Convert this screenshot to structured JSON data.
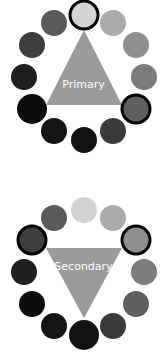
{
  "wheels": [
    {
      "name": "primary",
      "label": "Primary",
      "triangle_color": "#9a9a9a",
      "triangle_orientation": "up",
      "circle_colors": [
        "#d3d3d3",
        "#ababab",
        "#8f8f8f",
        "#7b7b7b",
        "#5f5f5f",
        "#3a3a3a",
        "#111111",
        "#141414",
        "#0d0d0d",
        "#0e0e0e",
        "#1f1f1f",
        "#3d3d3d",
        "#5a5a5a"
      ],
      "highlighted": [
        0,
        4
      ]
    },
    {
      "name": "secondary",
      "label": "Secondary",
      "triangle_color": "#9a9a9a",
      "triangle_orientation": "down",
      "circle_colors": [
        "#d3d3d3",
        "#ababab",
        "#8f8f8f",
        "#7b7b7b",
        "#5f5f5f",
        "#3a3a3a",
        "#111111",
        "#141414",
        "#0d0d0d",
        "#0e0e0e",
        "#1f1f1f",
        "#3d3d3d",
        "#5a5a5a"
      ],
      "highlighted": [
        2,
        10
      ]
    }
  ]
}
